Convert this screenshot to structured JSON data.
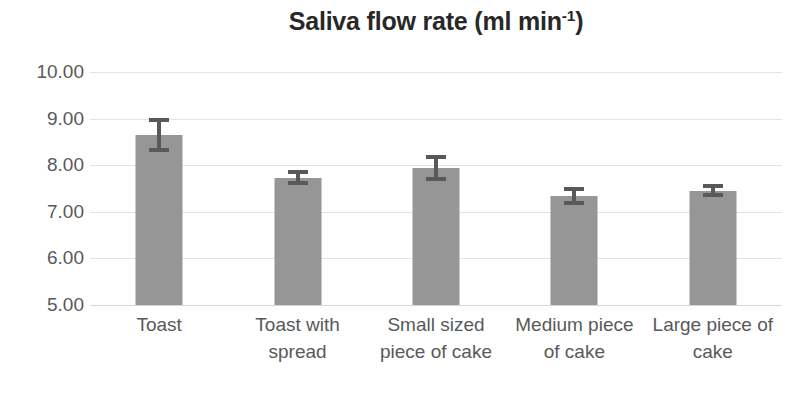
{
  "chart_data": {
    "type": "bar",
    "title": "Saliva flow rate (ml min-1)",
    "title_main": "Saliva flow rate (ml min",
    "title_sup": "-1",
    "title_tail": ")",
    "xlabel": "",
    "ylabel": "",
    "ylim": [
      5.0,
      10.0
    ],
    "ytick_step": 1.0,
    "ytick_labels": [
      "10.00",
      "9.00",
      "8.00",
      "7.00",
      "6.00",
      "5.00"
    ],
    "ytick_values": [
      10.0,
      9.0,
      8.0,
      7.0,
      6.0,
      5.0
    ],
    "grid": "horizontal",
    "legend": "none",
    "bar_color": "#969696",
    "error_color": "#595959",
    "gridline_color": "#e2e2e2",
    "text_color": "#595959",
    "title_color": "#282828",
    "categories": [
      "Toast",
      "Toast with spread",
      "Small sized piece of cake",
      "Medium piece of cake",
      "Large piece of cake"
    ],
    "category_lines": [
      [
        "Toast"
      ],
      [
        "Toast with",
        "spread"
      ],
      [
        "Small sized",
        "piece of cake"
      ],
      [
        "Medium piece",
        "of cake"
      ],
      [
        "Large piece of",
        "cake"
      ]
    ],
    "values": [
      8.65,
      7.73,
      7.94,
      7.34,
      7.45
    ],
    "errors": [
      0.37,
      0.16,
      0.28,
      0.2,
      0.14
    ],
    "series": [
      {
        "name": "Saliva flow rate",
        "values": [
          8.65,
          7.73,
          7.94,
          7.34,
          7.45
        ],
        "errors": [
          0.37,
          0.16,
          0.28,
          0.2,
          0.14
        ]
      }
    ]
  }
}
